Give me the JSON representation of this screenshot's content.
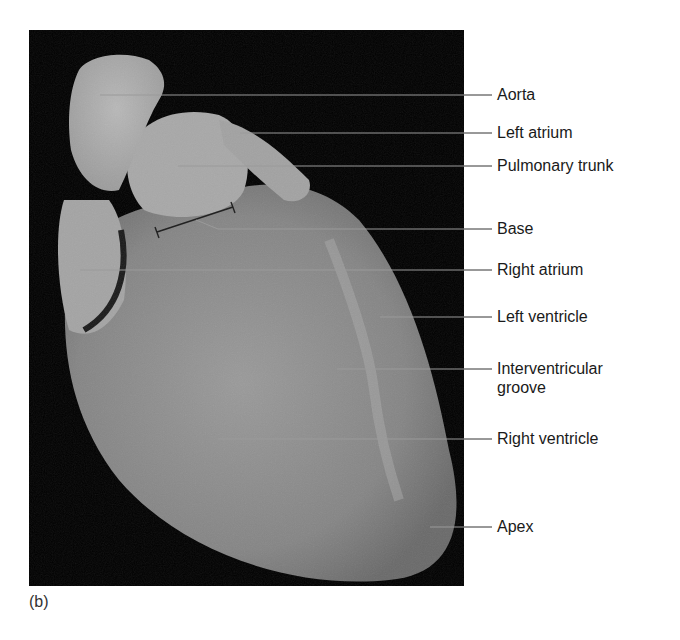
{
  "figure": {
    "caption": "(b)",
    "background_color": "#000000",
    "tissue_color": "#8e8e8e",
    "leader_line_color": "#9a9a9a",
    "leader_line_outside_color": "#333333",
    "bracket_label": "Base"
  },
  "labels": [
    {
      "id": "aorta",
      "text": "Aorta",
      "line_y": 95,
      "start_x": 100
    },
    {
      "id": "left-atrium",
      "text": "Left atrium",
      "line_y": 133,
      "start_x": 240
    },
    {
      "id": "pulmonary-trunk",
      "text": "Pulmonary trunk",
      "line_y": 166,
      "start_x": 178
    },
    {
      "id": "base",
      "text": "Base",
      "line_y": 229,
      "start_x": 218
    },
    {
      "id": "right-atrium",
      "text": "Right atrium",
      "line_y": 270,
      "start_x": 80
    },
    {
      "id": "left-ventricle",
      "text": "Left ventricle",
      "line_y": 317,
      "start_x": 380
    },
    {
      "id": "interventricular-groove",
      "text": "Interventricular",
      "text2": "groove",
      "line_y": 369,
      "start_x": 337
    },
    {
      "id": "right-ventricle",
      "text": "Right ventricle",
      "line_y": 439,
      "start_x": 218
    },
    {
      "id": "apex",
      "text": "Apex",
      "line_y": 527,
      "start_x": 430
    }
  ]
}
